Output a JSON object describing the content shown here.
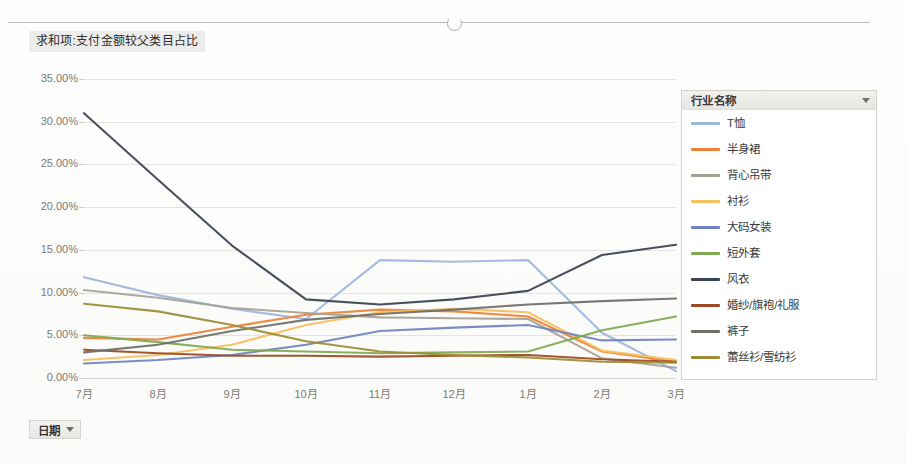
{
  "chart_object": {
    "title": "求和项:支付金额较父类目占比",
    "legend_header": "行业名称",
    "date_field_label": "日期",
    "caret_icon": "chevron-down-icon",
    "size_handle_icon": "resize-handle-icon"
  },
  "chart_data": {
    "type": "line",
    "title": "求和项:支付金额较父类目占比",
    "xlabel": "",
    "ylabel": "",
    "ylim": [
      0,
      0.35
    ],
    "ytick_labels": [
      "35.00%",
      "30.00%",
      "25.00%",
      "20.00%",
      "15.00%",
      "10.00%",
      "5.00%",
      "0.00%"
    ],
    "ytick_values": [
      0.35,
      0.3,
      0.25,
      0.2,
      0.15,
      0.1,
      0.05,
      0.0
    ],
    "grid": true,
    "legend_position": "right",
    "legend_title": "行业名称",
    "categories": [
      "7月",
      "8月",
      "9月",
      "10月",
      "11月",
      "12月",
      "1月",
      "2月",
      "3月"
    ],
    "series": [
      {
        "name": "T恤",
        "color": "#9cb7dd",
        "values": [
          0.118,
          0.097,
          0.081,
          0.069,
          0.138,
          0.136,
          0.138,
          0.053,
          0.008
        ]
      },
      {
        "name": "半身裙",
        "color": "#ee8137",
        "values": [
          0.047,
          0.045,
          0.06,
          0.074,
          0.08,
          0.078,
          0.072,
          0.031,
          0.019
        ]
      },
      {
        "name": "背心吊带",
        "color": "#a6a29a",
        "values": [
          0.103,
          0.094,
          0.082,
          0.076,
          0.071,
          0.07,
          0.069,
          0.023,
          0.012
        ]
      },
      {
        "name": "衬衫",
        "color": "#f7c05f",
        "values": [
          0.021,
          0.027,
          0.039,
          0.062,
          0.077,
          0.081,
          0.077,
          0.032,
          0.021
        ]
      },
      {
        "name": "大码女装",
        "color": "#6f84bc",
        "values": [
          0.017,
          0.021,
          0.027,
          0.039,
          0.055,
          0.059,
          0.062,
          0.044,
          0.045
        ]
      },
      {
        "name": "短外套",
        "color": "#7faa52",
        "values": [
          0.05,
          0.042,
          0.033,
          0.031,
          0.029,
          0.03,
          0.031,
          0.056,
          0.072
        ]
      },
      {
        "name": "风衣",
        "color": "#3a4352",
        "values": [
          0.31,
          0.232,
          0.155,
          0.092,
          0.086,
          0.092,
          0.102,
          0.144,
          0.156
        ]
      },
      {
        "name": "婚纱/旗袍/礼服",
        "color": "#9b4a22",
        "values": [
          0.033,
          0.029,
          0.026,
          0.026,
          0.025,
          0.026,
          0.027,
          0.022,
          0.019
        ]
      },
      {
        "name": "裤子",
        "color": "#6f6f69",
        "values": [
          0.03,
          0.039,
          0.055,
          0.068,
          0.075,
          0.08,
          0.086,
          0.09,
          0.093
        ]
      },
      {
        "name": "蕾丝衫/雪纺衫",
        "color": "#9d8c36",
        "values": [
          0.087,
          0.078,
          0.062,
          0.043,
          0.031,
          0.027,
          0.024,
          0.019,
          0.018
        ]
      }
    ]
  }
}
